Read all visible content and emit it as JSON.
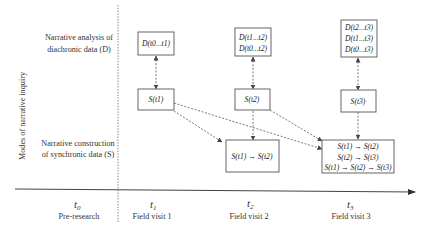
{
  "y_axis_label": "Modes of narrative inquiry",
  "rows": {
    "diachronic": {
      "line1": "Narrative analysis of",
      "line2": "diachronic data (D)"
    },
    "synchronic": {
      "line1": "Narrative construction",
      "line2": "of synchronic data (S)"
    }
  },
  "time_axis": {
    "points": [
      {
        "symbol": "t0",
        "label": "Pre-research"
      },
      {
        "symbol": "t1",
        "label": "Field visit 1"
      },
      {
        "symbol": "t2",
        "label": "Field visit 2"
      },
      {
        "symbol": "t3",
        "label": "Field visit 3"
      }
    ]
  },
  "boxes": {
    "d_t1": [
      "D(t0...t1)"
    ],
    "d_t2": [
      "D(t1...t2)",
      "D(t0...t2)"
    ],
    "d_t3": [
      "D(t2...t3)",
      "D(t1...t3)",
      "D(t0...t3)"
    ],
    "s_t1": [
      "S(t1)"
    ],
    "s_t2": [
      "S(t2)"
    ],
    "s_t3": [
      "S(t3)"
    ],
    "sync_t2": [
      "S(t1) → S(t2)"
    ],
    "sync_t3": [
      "S(t1) → S(t2)",
      "S(t2) → S(t3)",
      "S(t1) → S(t2) → S(t3)"
    ]
  },
  "arrows": [
    {
      "from": "d_t1",
      "to": "s_t1",
      "style": "dashed",
      "bidirectional": true
    },
    {
      "from": "d_t2",
      "to": "s_t2",
      "style": "dashed",
      "bidirectional": true
    },
    {
      "from": "d_t3",
      "to": "s_t3",
      "style": "dashed",
      "bidirectional": true
    },
    {
      "from": "s_t1",
      "to": "sync_t2",
      "style": "dashed"
    },
    {
      "from": "s_t1",
      "to": "sync_t3",
      "style": "dashed"
    },
    {
      "from": "s_t2",
      "to": "sync_t2",
      "style": "dashed"
    },
    {
      "from": "s_t2",
      "to": "sync_t3",
      "style": "dashed"
    },
    {
      "from": "s_t3",
      "to": "sync_t3",
      "style": "dashed"
    }
  ]
}
